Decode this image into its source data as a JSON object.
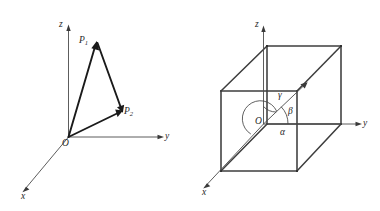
{
  "figure": {
    "background_color": "#ffffff",
    "stroke_color": "#1a1a1a",
    "axis_color": "#4b4b4b",
    "cube_color": "#3d3d3d",
    "panels": [
      {
        "id": "triangle-panel",
        "name": "vector-triangle-diagram",
        "description": "Two position vectors from origin O to points P1 and P2 in a 3D coordinate frame, with the closing segment P1 to P2",
        "axes": [
          {
            "name": "z",
            "label": "z"
          },
          {
            "name": "y",
            "label": "y"
          },
          {
            "name": "x",
            "label": "x"
          }
        ],
        "origin_label": "O",
        "points": [
          {
            "name": "P1",
            "label": "P",
            "subscript": "1"
          },
          {
            "name": "P2",
            "label": "P",
            "subscript": "2"
          }
        ]
      },
      {
        "id": "cube-panel",
        "name": "direction-angles-cube-diagram",
        "description": "A rectangular box (cube) drawn in 3D with a space diagonal from origin O, showing direction angles alpha, beta and gamma measured from the x, y and z axes",
        "axes": [
          {
            "name": "z",
            "label": "z"
          },
          {
            "name": "y",
            "label": "y"
          },
          {
            "name": "x",
            "label": "x"
          }
        ],
        "origin_label": "O",
        "angles": [
          {
            "name": "gamma",
            "label": "γ",
            "measured_from_axis": "z"
          },
          {
            "name": "beta",
            "label": "β",
            "measured_from_axis": "y"
          },
          {
            "name": "alpha",
            "label": "α",
            "measured_from_axis": "x"
          }
        ]
      }
    ]
  },
  "labels": {
    "left_z": "z",
    "left_y": "y",
    "left_x": "x",
    "left_origin": "O",
    "p1_base": "P",
    "p1_sub": "1",
    "p2_base": "P",
    "p2_sub": "2",
    "right_z": "z",
    "right_y": "y",
    "right_x": "x",
    "right_origin": "O",
    "gamma": "γ",
    "beta": "β",
    "alpha": "α"
  }
}
